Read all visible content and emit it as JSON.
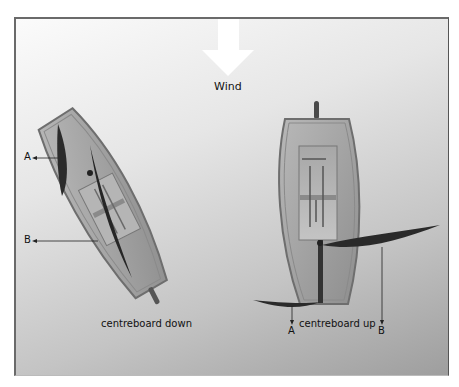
{
  "wind": {
    "label": "Wind",
    "icon": "wind-arrow-down"
  },
  "boats": [
    {
      "caption": "centreboard down",
      "markers": [
        {
          "label": "A"
        },
        {
          "label": "B"
        }
      ]
    },
    {
      "caption": "centreboard up",
      "markers": [
        {
          "label": "A"
        },
        {
          "label": "B"
        }
      ]
    }
  ],
  "colors": {
    "hull_outline": "#7a7a7a",
    "hull_fill": "#a9a9a9",
    "sail": "#2b2b2b",
    "arrow": "#ffffff"
  }
}
